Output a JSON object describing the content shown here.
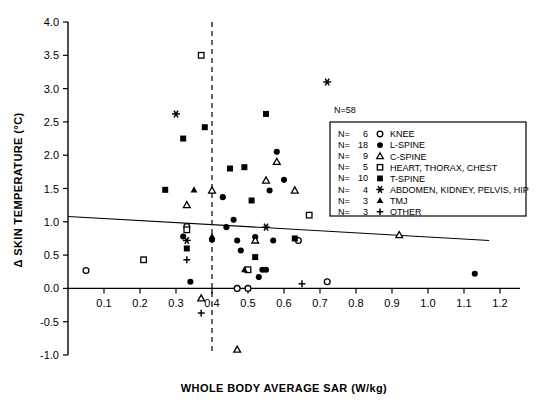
{
  "chart_data": {
    "type": "scatter",
    "title": "",
    "xlabel": "WHOLE BODY AVERAGE SAR (W/kg)",
    "ylabel": "Δ SKIN TEMPERATURE (°C)",
    "xlim": [
      0.0,
      1.2
    ],
    "ylim": [
      -1.0,
      4.0
    ],
    "xticks": [
      "0.1",
      "0.2",
      "0.3",
      "0.4",
      "0.5",
      "0.6",
      "0.7",
      "0.8",
      "0.9",
      "1.0",
      "1.1",
      "1.2"
    ],
    "xtick_values": [
      0.1,
      0.2,
      0.3,
      0.4,
      0.5,
      0.6,
      0.7,
      0.8,
      0.9,
      1.0,
      1.1,
      1.2
    ],
    "yticks": [
      "4.0",
      "3.5",
      "3.0",
      "2.5",
      "2.0",
      "1.5",
      "1.0",
      "0.5",
      "0.0",
      "-0.5",
      "-1.0"
    ],
    "ytick_values": [
      4.0,
      3.5,
      3.0,
      2.5,
      2.0,
      1.5,
      1.0,
      0.5,
      0.0,
      -0.5,
      -1.0
    ],
    "grid": false,
    "legend_position": "upper-right",
    "total_label": "N=58",
    "total_n": 58,
    "reference_line": {
      "orientation": "vertical",
      "x": 0.4,
      "style": "dashed"
    },
    "regression_line": {
      "x_start": 0.0,
      "y_start": 1.08,
      "x_end": 1.17,
      "y_end": 0.72,
      "style": "solid"
    },
    "series": [
      {
        "name": "KNEE",
        "marker": "open-circle",
        "n_label": "N=",
        "n_value": "6",
        "points": [
          [
            0.05,
            0.27
          ],
          [
            0.33,
            0.93
          ],
          [
            0.47,
            0.0
          ],
          [
            0.5,
            0.0
          ],
          [
            0.64,
            0.72
          ],
          [
            0.72,
            0.1
          ]
        ]
      },
      {
        "name": "L-SPINE",
        "marker": "filled-circle",
        "n_label": "N=",
        "n_value": "18",
        "points": [
          [
            0.32,
            0.78
          ],
          [
            0.34,
            0.1
          ],
          [
            0.4,
            0.73
          ],
          [
            0.43,
            1.37
          ],
          [
            0.44,
            0.92
          ],
          [
            0.46,
            1.03
          ],
          [
            0.47,
            0.72
          ],
          [
            0.48,
            0.57
          ],
          [
            0.5,
            0.28
          ],
          [
            0.52,
            0.77
          ],
          [
            0.53,
            0.17
          ],
          [
            0.54,
            0.28
          ],
          [
            0.55,
            0.28
          ],
          [
            0.56,
            1.47
          ],
          [
            0.57,
            0.72
          ],
          [
            0.58,
            2.05
          ],
          [
            0.6,
            1.63
          ],
          [
            1.13,
            0.22
          ]
        ]
      },
      {
        "name": "C-SPINE",
        "marker": "open-triangle",
        "n_label": "N=",
        "n_value": "9",
        "points": [
          [
            0.33,
            1.25
          ],
          [
            0.37,
            -0.15
          ],
          [
            0.4,
            1.47
          ],
          [
            0.47,
            -0.92
          ],
          [
            0.52,
            0.72
          ],
          [
            0.55,
            1.62
          ],
          [
            0.58,
            1.9
          ],
          [
            0.63,
            1.47
          ],
          [
            0.92,
            0.8
          ]
        ]
      },
      {
        "name": "HEART, THORAX, CHEST",
        "marker": "open-square",
        "n_label": "N=",
        "n_value": "5",
        "points": [
          [
            0.21,
            0.43
          ],
          [
            0.37,
            3.5
          ],
          [
            0.33,
            0.88
          ],
          [
            0.5,
            0.28
          ],
          [
            0.67,
            1.1
          ]
        ]
      },
      {
        "name": "T-SPINE",
        "marker": "filled-square",
        "n_label": "N=",
        "n_value": "10",
        "points": [
          [
            0.27,
            1.48
          ],
          [
            0.32,
            2.25
          ],
          [
            0.33,
            0.6
          ],
          [
            0.38,
            2.42
          ],
          [
            0.45,
            1.8
          ],
          [
            0.49,
            1.82
          ],
          [
            0.51,
            1.32
          ],
          [
            0.52,
            0.47
          ],
          [
            0.55,
            2.62
          ],
          [
            0.63,
            0.75
          ]
        ]
      },
      {
        "name": "ABDOMEN, KIDNEY, PELVIS, HIP",
        "marker": "asterisk",
        "n_label": "N=",
        "n_value": "4",
        "points": [
          [
            0.3,
            2.62
          ],
          [
            0.33,
            0.72
          ],
          [
            0.55,
            0.92
          ],
          [
            0.72,
            3.1
          ]
        ]
      },
      {
        "name": "TMJ",
        "marker": "filled-triangle",
        "n_label": "N=",
        "n_value": "3",
        "points": [
          [
            0.35,
            1.48
          ],
          [
            0.4,
            0.78
          ],
          [
            0.49,
            0.28
          ]
        ]
      },
      {
        "name": "OTHER",
        "marker": "plus",
        "n_label": "N=",
        "n_value": "3",
        "points": [
          [
            0.33,
            0.43
          ],
          [
            0.37,
            -0.37
          ],
          [
            0.65,
            0.07
          ]
        ]
      }
    ]
  }
}
